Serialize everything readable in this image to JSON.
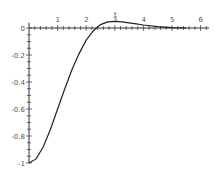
{
  "chart_data": {
    "type": "line",
    "title": "",
    "xlabel": "t",
    "ylabel": "",
    "xlim": [
      0,
      6.3
    ],
    "ylim": [
      -1,
      0.05
    ],
    "x_ticks": [
      "1",
      "2",
      "3",
      "4",
      "5",
      "6"
    ],
    "y_ticks": [
      "0",
      "-0.2",
      "-0.4",
      "-0.6",
      "-0.8",
      "-1"
    ],
    "grid": false,
    "legend": null,
    "series": [
      {
        "name": "f(t)",
        "x": [
          0,
          0.25,
          0.5,
          0.75,
          1.0,
          1.25,
          1.5,
          1.75,
          2.0,
          2.25,
          2.5,
          2.75,
          3.0,
          3.25,
          3.5,
          3.75,
          4.0,
          4.5,
          5.0,
          5.5
        ],
        "values": [
          -1.0,
          -0.97,
          -0.88,
          -0.75,
          -0.6,
          -0.45,
          -0.31,
          -0.19,
          -0.09,
          -0.02,
          0.025,
          0.045,
          0.05,
          0.045,
          0.038,
          0.03,
          0.022,
          0.01,
          0.003,
          0.0
        ]
      }
    ]
  }
}
